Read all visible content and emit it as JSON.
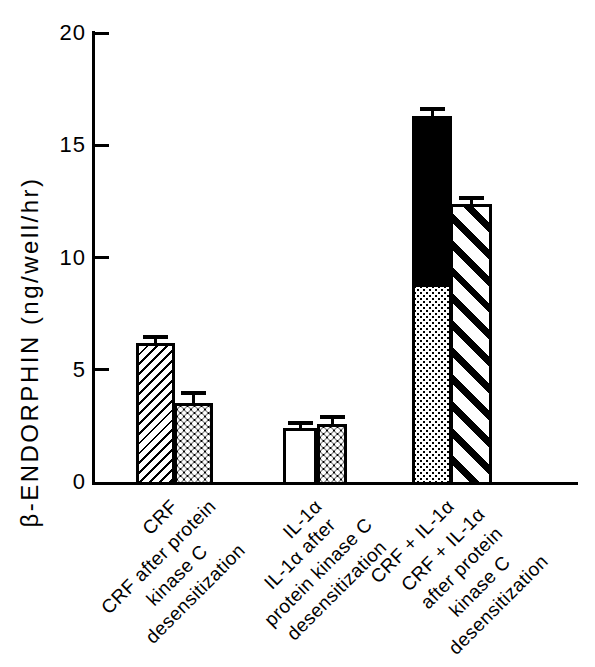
{
  "figure": {
    "background_color": "#ffffff",
    "ink_color": "#000000"
  },
  "chart_data": {
    "type": "bar",
    "title": "",
    "xlabel": "",
    "ylabel": "β-ENDORPHIN (ng/well/hr)",
    "ylim": [
      0,
      20
    ],
    "yticks": [
      0,
      5,
      10,
      15,
      20
    ],
    "grid": false,
    "legend_position": "none",
    "error_bars": "upper caps only",
    "categories": [
      "CRF",
      "CRF after protein kinase C desensitization",
      "IL-1α",
      "IL-1α after protein kinase C desensitization",
      "CRF + IL-1α",
      "CRF + IL-1α after protein kinase C desensitization"
    ],
    "bars": [
      {
        "label_lines": [
          "CRF"
        ],
        "value": 6.2,
        "error": 0.25,
        "pattern": "thin-diagonal-hatch-up"
      },
      {
        "label_lines": [
          "CRF after protein",
          "kinase C",
          "desensitization"
        ],
        "value": 3.5,
        "error": 0.45,
        "pattern": "black-checker-white-dots"
      },
      {
        "label_lines": [
          "IL-1α"
        ],
        "value": 2.4,
        "error": 0.25,
        "pattern": "open-white"
      },
      {
        "label_lines": [
          "IL-1α after",
          "protein kinase C",
          "desensitization"
        ],
        "value": 2.6,
        "error": 0.3,
        "pattern": "black-checker-white-dots"
      },
      {
        "label_lines": [
          "CRF + IL-1α"
        ],
        "value": 16.3,
        "error": 0.3,
        "pattern": "stacked",
        "segments": [
          {
            "pattern": "fine-stipple",
            "value": 8.7
          },
          {
            "pattern": "solid-black",
            "value": 7.6
          }
        ]
      },
      {
        "label_lines": [
          "CRF + IL-1α",
          "after protein",
          "kinase C",
          "desensitization"
        ],
        "value": 12.4,
        "error": 0.25,
        "pattern": "wide-diagonal-stripes-down"
      }
    ]
  }
}
